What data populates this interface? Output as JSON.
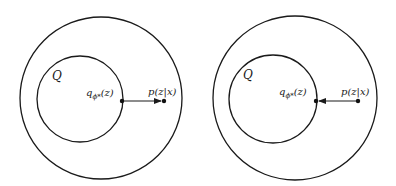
{
  "panels": [
    {
      "name": "left-panel",
      "set_label": "Q",
      "q_label": {
        "base": "q",
        "sub": "ϕ*",
        "arg": "(z)"
      },
      "p_label": "p(z|x)",
      "arrow_direction": "q-to-p",
      "outer_circle": {
        "cx": 101,
        "cy": 98,
        "r": 81
      },
      "inner_circle": {
        "cx": 80,
        "cy": 99,
        "r": 43
      },
      "q_point": {
        "x": 122,
        "y": 101
      },
      "p_point": {
        "x": 164,
        "y": 101
      }
    },
    {
      "name": "right-panel",
      "set_label": "Q",
      "q_label": {
        "base": "q",
        "sub": "ϕ*",
        "arg": "(z)"
      },
      "p_label": "p(z|x)",
      "arrow_direction": "p-to-q",
      "outer_circle": {
        "cx": 295,
        "cy": 98,
        "r": 82
      },
      "inner_circle": {
        "cx": 273,
        "cy": 99,
        "r": 44
      },
      "q_point": {
        "x": 316,
        "y": 101
      },
      "p_point": {
        "x": 358,
        "y": 101
      }
    }
  ],
  "colors": {
    "stroke": "#1a1a1a",
    "background": "#ffffff"
  }
}
